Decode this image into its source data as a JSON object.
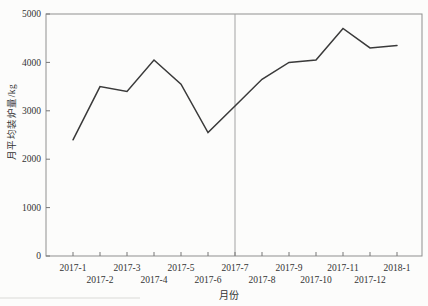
{
  "chart_data": {
    "type": "line",
    "title": "",
    "xlabel": "月份",
    "ylabel": "月平均装炉量/kg",
    "categories": [
      "2017-1",
      "2017-2",
      "2017-3",
      "2017-4",
      "2017-5",
      "2017-6",
      "2017-7",
      "2017-8",
      "2017-9",
      "2017-10",
      "2017-11",
      "2017-12",
      "2018-1"
    ],
    "values": [
      2400,
      3500,
      3400,
      4050,
      3550,
      2550,
      3100,
      3650,
      4000,
      4050,
      4700,
      4300,
      4350
    ],
    "ylim": [
      0,
      5000
    ],
    "yticks": [
      0,
      1000,
      2000,
      3000,
      4000,
      5000
    ],
    "grid": false,
    "legend": "none",
    "x_label_stagger": true,
    "reference_line": {
      "axis": "x",
      "at_category": "2017-7"
    },
    "colors": {
      "line": "#3a3a3a",
      "frame": "#8f8f8f",
      "reference_line": "#a3a3a3",
      "tick": "#777777",
      "text": "#333333",
      "background": "#fcfcfb"
    }
  }
}
